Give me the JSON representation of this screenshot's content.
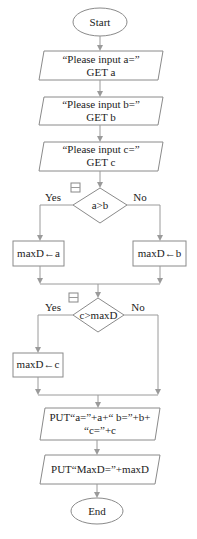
{
  "flowchart": {
    "start": {
      "label": "Start"
    },
    "inputs": [
      {
        "line1": "“Please input a=”",
        "line2": "GET a"
      },
      {
        "line1": "“Please input b=”",
        "line2": "GET b"
      },
      {
        "line1": "“Please input c=”",
        "line2": "GET c"
      }
    ],
    "decision1": {
      "condition": "a>b",
      "yes_label": "Yes",
      "no_label": "No",
      "collapse_icon": "minus-box-icon",
      "yes_action": "maxD←a",
      "no_action": "maxD←b"
    },
    "decision2": {
      "condition": "c>maxD",
      "yes_label": "Yes",
      "no_label": "No",
      "collapse_icon": "minus-box-icon",
      "yes_action": "maxD←c"
    },
    "outputs": [
      {
        "line1": "PUT“a=”+a+“ b=”+b+",
        "line2": "“c=”+c"
      },
      {
        "line1": "PUT“MaxD=”+maxD"
      }
    ],
    "end": {
      "label": "End"
    },
    "colors": {
      "stroke": "#8a8a8a",
      "connector": "#9a9a9a",
      "text": "#222222"
    }
  }
}
